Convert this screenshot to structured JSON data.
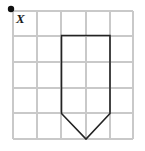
{
  "figure": {
    "background_color": "#ffffff",
    "grid": {
      "name": "square-grid",
      "columns": 5,
      "rows": 5,
      "cell_size": 24,
      "x_positions": [
        13,
        37,
        61,
        86,
        110,
        133
      ],
      "y_positions": [
        11,
        36,
        62,
        88,
        113,
        139
      ],
      "line_color": "#c9c9c9",
      "line_width": 1.1,
      "border_color": "#c9c9c9"
    },
    "point": {
      "name": "point-x",
      "label": "X",
      "dot_color": "#111111",
      "dot_radius": 3.2,
      "dot_x": 11,
      "dot_y": 9,
      "label_x": 16,
      "label_y": 22,
      "grid_coordinates": [
        0,
        5
      ]
    },
    "shape": {
      "name": "pentagon-shape",
      "kind": "pentagon",
      "stroke_color": "#232323",
      "stroke_width": 1.6,
      "fill": "none",
      "vertices": [
        {
          "label": "top-left",
          "x": 61.5,
          "y": 35.5,
          "grid": [
            2,
            4
          ]
        },
        {
          "label": "top-right",
          "x": 110,
          "y": 35.5,
          "grid": [
            4,
            4
          ]
        },
        {
          "label": "bottom-right",
          "x": 110,
          "y": 113.5,
          "grid": [
            4,
            1
          ]
        },
        {
          "label": "apex",
          "x": 86,
          "y": 139,
          "grid": [
            3,
            0
          ]
        },
        {
          "label": "bottom-left",
          "x": 61.5,
          "y": 113.5,
          "grid": [
            2,
            1
          ]
        }
      ],
      "points_attr": "61.5,35.5 110,35.5 110,113.5 86,139 61.5,113.5"
    }
  }
}
